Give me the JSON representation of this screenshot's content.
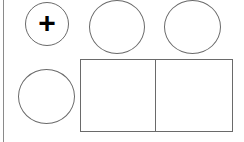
{
  "canvas": {
    "width": 244,
    "height": 142,
    "background": "#ffffff"
  },
  "buttons": [
    {
      "name": "add-button",
      "icon": "plus-icon",
      "glyph": "+"
    },
    {
      "name": "circle-button-2"
    },
    {
      "name": "circle-button-3"
    },
    {
      "name": "circle-button-4"
    }
  ],
  "panel": {
    "cells": 2
  },
  "colors": {
    "stroke": "#6a6a6a",
    "icon": "#000000"
  }
}
